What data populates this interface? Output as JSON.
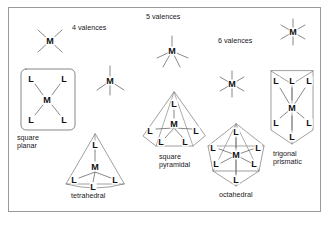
{
  "figure": {
    "background": "#ffffff",
    "border_color": "#9a9a9a",
    "line_color": "#555555",
    "atom_color": "#111111"
  },
  "valence_headings": [
    {
      "id": "v4",
      "label": "4 valences",
      "x": 72,
      "y": 28
    },
    {
      "id": "v5",
      "label": "5 valences",
      "x": 146,
      "y": 17
    },
    {
      "id": "v6",
      "label": "6 valences",
      "x": 218,
      "y": 41
    }
  ],
  "valence_icons": [
    {
      "id": "icon-4-square-planar",
      "atom": "M",
      "cx": 50,
      "cy": 41,
      "rays": 4,
      "type": "cross"
    },
    {
      "id": "icon-4-tetrahedral",
      "atom": "M",
      "cx": 110,
      "cy": 81,
      "rays": 4,
      "type": "tripod"
    },
    {
      "id": "icon-5-square-pyramidal",
      "atom": "M",
      "cx": 172,
      "cy": 51,
      "rays": 5,
      "type": "tripod"
    },
    {
      "id": "icon-6-octahedral",
      "atom": "M",
      "cx": 232,
      "cy": 84,
      "rays": 6,
      "type": "star"
    },
    {
      "id": "icon-6-trigonal-prismatic",
      "atom": "M",
      "cx": 293,
      "cy": 32,
      "rays": 6,
      "type": "star"
    }
  ],
  "structures": [
    {
      "id": "square-planar",
      "label": "square\nplanar",
      "label_x": 17,
      "label_y": 124,
      "center_atom": "M",
      "ligands": [
        "L",
        "L",
        "L",
        "L"
      ],
      "ligand_count": 4
    },
    {
      "id": "tetrahedral",
      "label": "tetrahedral",
      "label_x": 71,
      "label_y": 199,
      "center_atom": "M",
      "ligands": [
        "L",
        "L",
        "L",
        "L"
      ],
      "ligand_count": 4
    },
    {
      "id": "square-pyramidal",
      "label": "square\npyramidal",
      "label_x": 159,
      "label_y": 152,
      "center_atom": "M",
      "ligands": [
        "L",
        "L",
        "L",
        "L",
        "L"
      ],
      "ligand_count": 5
    },
    {
      "id": "octahedral",
      "label": "octahedral",
      "label_x": 219,
      "label_y": 193,
      "center_atom": "M",
      "ligands": [
        "L",
        "L",
        "L",
        "L",
        "L",
        "L"
      ],
      "ligand_count": 6
    },
    {
      "id": "trigonal-prismatic",
      "label": "trigonal\nprismatic",
      "label_x": 273,
      "label_y": 153,
      "center_atom": "M",
      "ligands": [
        "L",
        "L",
        "L",
        "L",
        "L",
        "L"
      ],
      "ligand_count": 6
    }
  ],
  "atoms": {
    "square_planar": [
      {
        "t": "L",
        "x": 31,
        "y": 79
      },
      {
        "t": "L",
        "x": 64,
        "y": 79
      },
      {
        "t": "M",
        "x": 47,
        "y": 100
      },
      {
        "t": "L",
        "x": 31,
        "y": 120
      },
      {
        "t": "L",
        "x": 64,
        "y": 120
      }
    ],
    "tetrahedral": [
      {
        "t": "L",
        "x": 95,
        "y": 145
      },
      {
        "t": "M",
        "x": 95,
        "y": 167
      },
      {
        "t": "L",
        "x": 74,
        "y": 180
      },
      {
        "t": "L",
        "x": 93,
        "y": 187
      },
      {
        "t": "L",
        "x": 115,
        "y": 180
      }
    ],
    "square_pyramidal": [
      {
        "t": "L",
        "x": 174,
        "y": 104
      },
      {
        "t": "M",
        "x": 174,
        "y": 124
      },
      {
        "t": "L",
        "x": 150,
        "y": 131
      },
      {
        "t": "L",
        "x": 196,
        "y": 131
      },
      {
        "t": "L",
        "x": 161,
        "y": 142
      },
      {
        "t": "L",
        "x": 185,
        "y": 142
      }
    ],
    "octahedral": [
      {
        "t": "L",
        "x": 236,
        "y": 132
      },
      {
        "t": "M",
        "x": 236,
        "y": 155
      },
      {
        "t": "L",
        "x": 213,
        "y": 148
      },
      {
        "t": "L",
        "x": 258,
        "y": 148
      },
      {
        "t": "L",
        "x": 216,
        "y": 164
      },
      {
        "t": "L",
        "x": 254,
        "y": 164
      },
      {
        "t": "L",
        "x": 236,
        "y": 180
      }
    ],
    "trigonal_prismatic": [
      {
        "t": "L",
        "x": 276,
        "y": 81
      },
      {
        "t": "L",
        "x": 292,
        "y": 81
      },
      {
        "t": "L",
        "x": 309,
        "y": 81
      },
      {
        "t": "M",
        "x": 292,
        "y": 108
      },
      {
        "t": "L",
        "x": 276,
        "y": 123
      },
      {
        "t": "L",
        "x": 309,
        "y": 123
      },
      {
        "t": "L",
        "x": 292,
        "y": 137
      }
    ]
  }
}
